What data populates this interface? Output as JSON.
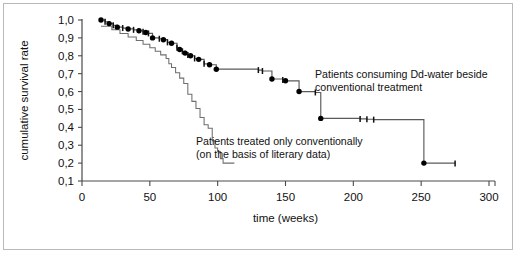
{
  "figure": {
    "title_visible": false,
    "border_color": "#b9b9b9",
    "background": "#ffffff"
  },
  "axes": {
    "x": {
      "label": "time (weeks)",
      "ticks": [
        0,
        50,
        100,
        150,
        200,
        250,
        300
      ],
      "tick_labels": [
        "0",
        "50",
        "100",
        "150",
        "200",
        "250",
        "300"
      ],
      "min": 0,
      "max": 300
    },
    "y": {
      "label": "cumulative survival rate",
      "ticks": [
        0.1,
        0.2,
        0.3,
        0.4,
        0.5,
        0.6,
        0.7,
        0.8,
        0.9,
        1.0
      ],
      "tick_labels": [
        "0,1",
        "0,2",
        "0,3",
        "0,4",
        "0,5",
        "0,6",
        "0,7",
        "0,8",
        "0,9",
        "1,0"
      ],
      "min": 0.1,
      "max": 1.0
    }
  },
  "annotations": [
    {
      "id": "annot-dd-water",
      "lines": [
        "Patients consuming Dd-water beside",
        "conventional treatment"
      ],
      "x": 315,
      "y": 78
    },
    {
      "id": "annot-conventional",
      "lines": [
        "Patients treated only conventionally",
        "(on the basis of literary data)"
      ],
      "x": 196,
      "y": 145
    }
  ],
  "chart_data": {
    "type": "line",
    "subtype": "kaplan-meier-survival",
    "title": "",
    "xlabel": "time (weeks)",
    "ylabel": "cumulative survival rate",
    "xlim": [
      0,
      300
    ],
    "ylim": [
      0.1,
      1.0
    ],
    "grid": false,
    "legend_position": "inline-annotations",
    "decimal_separator": ",",
    "series": [
      {
        "name": "Patients consuming Dd-water beside conventional treatment",
        "label_short": "Dd-water + conventional",
        "color": "#5a5a5a",
        "marker": "filled-circle",
        "steps": [
          [
            14,
            1.0
          ],
          [
            17,
            0.99
          ],
          [
            20,
            0.98
          ],
          [
            23,
            0.97
          ],
          [
            26,
            0.96
          ],
          [
            30,
            0.955
          ],
          [
            34,
            0.95
          ],
          [
            38,
            0.945
          ],
          [
            42,
            0.94
          ],
          [
            45,
            0.935
          ],
          [
            47,
            0.93
          ],
          [
            49,
            0.925
          ],
          [
            52,
            0.9
          ],
          [
            57,
            0.895
          ],
          [
            60,
            0.89
          ],
          [
            63,
            0.875
          ],
          [
            66,
            0.87
          ],
          [
            70,
            0.845
          ],
          [
            72,
            0.835
          ],
          [
            74,
            0.825
          ],
          [
            76,
            0.815
          ],
          [
            78,
            0.805
          ],
          [
            80,
            0.8
          ],
          [
            83,
            0.785
          ],
          [
            86,
            0.78
          ],
          [
            90,
            0.755
          ],
          [
            94,
            0.75
          ],
          [
            99,
            0.725
          ],
          [
            130,
            0.72
          ],
          [
            133,
            0.715
          ],
          [
            140,
            0.67
          ],
          [
            148,
            0.665
          ],
          [
            150,
            0.66
          ],
          [
            160,
            0.6
          ],
          [
            172,
            0.595
          ],
          [
            176,
            0.45
          ],
          [
            205,
            0.447
          ],
          [
            210,
            0.445
          ],
          [
            215,
            0.443
          ],
          [
            252,
            0.2
          ],
          [
            275,
            0.198
          ]
        ],
        "event_points_weeks": [
          14,
          20,
          26,
          34,
          42,
          47,
          52,
          60,
          66,
          72,
          76,
          80,
          86,
          94,
          99,
          140,
          150,
          160,
          176,
          252
        ],
        "censored_points_weeks": [
          17,
          23,
          30,
          38,
          45,
          49,
          57,
          63,
          70,
          74,
          78,
          83,
          90,
          130,
          133,
          148,
          172,
          205,
          210,
          215,
          275
        ],
        "survival_start": 1.0,
        "survival_end": 0.2
      },
      {
        "name": "Patients treated only conventionally (on the basis of literary data)",
        "label_short": "Conventional only",
        "color": "#6e6e6e",
        "marker": "none",
        "steps": [
          [
            14,
            0.965
          ],
          [
            22,
            0.945
          ],
          [
            28,
            0.925
          ],
          [
            34,
            0.905
          ],
          [
            40,
            0.885
          ],
          [
            45,
            0.865
          ],
          [
            50,
            0.845
          ],
          [
            54,
            0.825
          ],
          [
            58,
            0.805
          ],
          [
            62,
            0.785
          ],
          [
            64,
            0.755
          ],
          [
            66,
            0.735
          ],
          [
            69,
            0.705
          ],
          [
            72,
            0.675
          ],
          [
            75,
            0.645
          ],
          [
            78,
            0.585
          ],
          [
            81,
            0.545
          ],
          [
            84,
            0.505
          ],
          [
            87,
            0.455
          ],
          [
            90,
            0.415
          ],
          [
            93,
            0.395
          ],
          [
            96,
            0.325
          ],
          [
            98,
            0.285
          ],
          [
            100,
            0.265
          ],
          [
            102,
            0.225
          ],
          [
            104,
            0.2
          ],
          [
            112,
            0.198
          ]
        ],
        "survival_start": 0.965,
        "survival_end": 0.2
      }
    ]
  }
}
